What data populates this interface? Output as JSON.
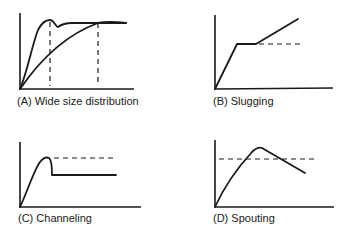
{
  "figure": {
    "panels": [
      {
        "id": "A",
        "caption": "(A) Wide size distribution"
      },
      {
        "id": "B",
        "caption": "(B) Slugging"
      },
      {
        "id": "C",
        "caption": "(C) Channeling"
      },
      {
        "id": "D",
        "caption": "(D) Spouting"
      }
    ]
  },
  "colors": {
    "ink": "#1a1a1a",
    "background": "#ffffff"
  }
}
